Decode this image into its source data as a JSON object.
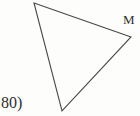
{
  "figure": {
    "canvas": {
      "width": 140,
      "height": 116,
      "background": "#fdfdfc"
    },
    "stroke_color": "#4a4a4a",
    "stroke_width": 1.1,
    "shape_name": "triangle",
    "vertices": [
      {
        "name": "top-left",
        "x": 34,
        "y": 3,
        "label": ""
      },
      {
        "name": "right",
        "x": 131,
        "y": 37,
        "label": "M"
      },
      {
        "name": "bottom",
        "x": 62,
        "y": 111,
        "label": ""
      }
    ],
    "polygon_points": "34,3 131,37 62,111",
    "labels": {
      "vertex_m": "M",
      "problem_number": "80)"
    }
  }
}
